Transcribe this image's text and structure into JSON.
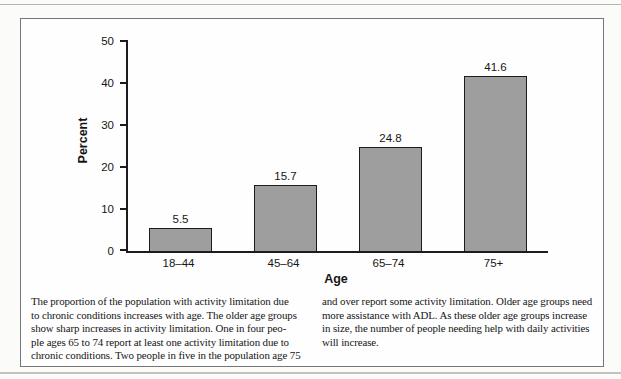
{
  "chart_data": {
    "type": "bar",
    "categories": [
      "18–44",
      "45–64",
      "65–74",
      "75+"
    ],
    "values": [
      5.5,
      15.7,
      24.8,
      41.6
    ],
    "title": "",
    "xlabel": "Age",
    "ylabel": "Percent",
    "ylim": [
      0,
      50
    ],
    "yticks": [
      0,
      10,
      20,
      30,
      40,
      50
    ],
    "grid": false,
    "legend": "none",
    "bar_fill": "#9e9e9e",
    "bar_border": "#1c1c1c"
  },
  "caption": {
    "left_lines": [
      "The proportion of the population with activity limitation due",
      "to chronic conditions increases with age. The older age groups",
      "show sharp increases in activity limitation. One in four peo-",
      "ple ages 65 to 74 report at least one activity limitation due to",
      "chronic conditions. Two people in five in the population age 75"
    ],
    "right_lines": [
      "and over report some activity limitation. Older age groups need",
      "more assistance with ADL. As these older age groups increase",
      "in size, the number of people needing help with daily activities",
      "will increase."
    ]
  },
  "colors": {
    "axis": "#1c1c1c",
    "figure_border": "#767676",
    "page_rule": "#b3b3b3",
    "bar_fill": "#9e9e9e",
    "bar_border": "#1c1c1c"
  }
}
